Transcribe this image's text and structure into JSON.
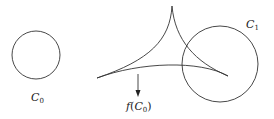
{
  "diagram": {
    "stroke_color": "#333333",
    "background": "#ffffff",
    "circle_c0": {
      "label_main": "C",
      "label_sub": "0",
      "cx": 36,
      "cy": 55,
      "r": 24
    },
    "circle_c1": {
      "label_main": "C",
      "label_sub": "1",
      "cx": 220,
      "cy": 64,
      "r": 38
    },
    "image_curve": {
      "label_func": "f",
      "label_open": "(",
      "label_main": "C",
      "label_sub": "0",
      "label_close": ")",
      "cusps": [
        {
          "name": "top",
          "x": 172,
          "y": 6
        },
        {
          "name": "left",
          "x": 97,
          "y": 78
        },
        {
          "name": "right",
          "x": 228,
          "y": 76
        }
      ]
    },
    "arrow": {
      "x": 138,
      "y1": 74,
      "y2": 96,
      "direction": "down"
    }
  }
}
